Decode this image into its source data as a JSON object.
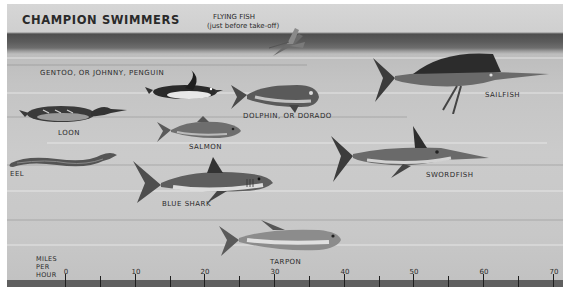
{
  "title": "CHAMPION SWIMMERS",
  "flying_fish": {
    "line1": "FLYING FISH",
    "line2": "(just before take-off)"
  },
  "animals": [
    {
      "id": "penguin",
      "label": "GENTOO, OR JOHNNY, PENGUIN"
    },
    {
      "id": "loon",
      "label": "LOON"
    },
    {
      "id": "eel",
      "label": "EEL"
    },
    {
      "id": "salmon",
      "label": "SALMON"
    },
    {
      "id": "dolphin",
      "label": "DOLPHIN, OR DORADO"
    },
    {
      "id": "sailfish",
      "label": "SAILFISH"
    },
    {
      "id": "blue-shark",
      "label": "BLUE SHARK"
    },
    {
      "id": "swordfish",
      "label": "SWORDFISH"
    },
    {
      "id": "tarpon",
      "label": "TARPON"
    }
  ],
  "scale": {
    "unit_line1": "MILES",
    "unit_line2": "PER",
    "unit_line3": "HOUR",
    "ticks": [
      "0",
      "10",
      "20",
      "30",
      "40",
      "50",
      "60",
      "70"
    ]
  },
  "colors": {
    "water_dark": "#4e4e4e",
    "background": "#c8c8c8",
    "ink": "#2a2a2a",
    "scale_bar": "#5f5f5f"
  }
}
